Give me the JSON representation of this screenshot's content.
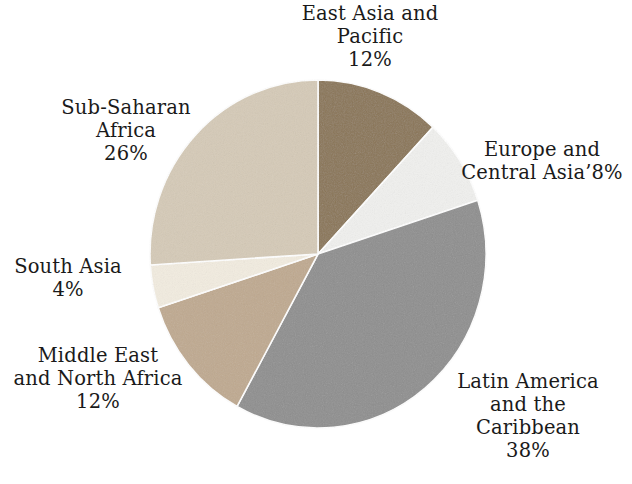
{
  "chart_data": {
    "type": "pie",
    "title": "",
    "subtitle": "",
    "xlabel": "",
    "ylabel": "",
    "legend_position": "none",
    "grid": false,
    "labels_outside": true,
    "start_angle_deg": 0,
    "direction": "clockwise",
    "categories": [
      "East Asia and Pacific",
      "Europe and Central Asia",
      "Latin America and the Caribbean",
      "Middle East and North Africa",
      "South Asia",
      "Sub-Saharan Africa"
    ],
    "values": [
      12,
      8,
      38,
      12,
      4,
      26
    ],
    "value_suffix": "%",
    "total": 100,
    "colors": [
      "#8a7556",
      "#f0f0ee",
      "#8e8e8e",
      "#bfa98f",
      "#f2ece0",
      "#d5cab7"
    ],
    "slices": [
      {
        "name": "East Asia and Pacific",
        "value": 12,
        "value_text": "12%",
        "color": "#8a7556",
        "start_deg": 0,
        "end_deg": 43.2,
        "label_lines": [
          "East Asia and",
          "Pacific"
        ]
      },
      {
        "name": "Europe and Central Asia",
        "value": 8,
        "value_text": "8%",
        "color": "#f0f0ee",
        "start_deg": 43.2,
        "end_deg": 72.0,
        "label_lines": [
          "Europe and",
          "Central Asia"
        ],
        "label_raw_second_line": "Central Asia’8%"
      },
      {
        "name": "Latin America and the Caribbean",
        "value": 38,
        "value_text": "38%",
        "color": "#8e8e8e",
        "start_deg": 72.0,
        "end_deg": 208.8,
        "label_lines": [
          "Latin America",
          "and the",
          "Caribbean"
        ]
      },
      {
        "name": "Middle East and North Africa",
        "value": 12,
        "value_text": "12%",
        "color": "#bfa98f",
        "start_deg": 208.8,
        "end_deg": 252.0,
        "label_lines": [
          "Middle East",
          "and North Africa"
        ]
      },
      {
        "name": "South Asia",
        "value": 4,
        "value_text": "4%",
        "color": "#f2ece0",
        "start_deg": 252.0,
        "end_deg": 266.4,
        "label_lines": [
          "South Asia"
        ]
      },
      {
        "name": "Sub-Saharan Africa",
        "value": 26,
        "value_text": "26%",
        "color": "#d5cab7",
        "start_deg": 266.4,
        "end_deg": 360.0,
        "label_lines": [
          "Sub-Saharan",
          "Africa"
        ]
      }
    ]
  },
  "labels": {
    "east_asia": {
      "line1": "East Asia and",
      "line2": "Pacific",
      "value": "12%"
    },
    "europe": {
      "line1": "Europe and",
      "line2": "Central Asia’8%"
    },
    "latin_america": {
      "line1": "Latin America",
      "line2": "and the",
      "line3": "Caribbean",
      "value": "38%"
    },
    "middle_east": {
      "line1": "Middle East",
      "line2": "and North Africa",
      "value": "12%"
    },
    "south_asia": {
      "line1": "South Asia",
      "value": "4%"
    },
    "sub_saharan": {
      "line1": "Sub-Saharan",
      "line2": "Africa",
      "value": "26%"
    }
  }
}
